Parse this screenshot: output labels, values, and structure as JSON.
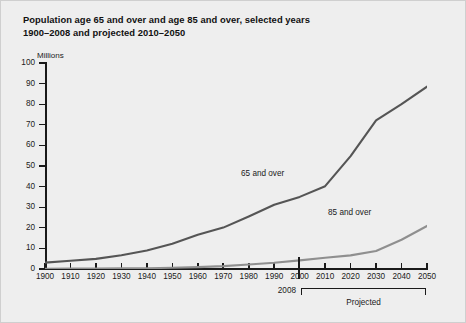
{
  "title": {
    "line1": "Population age 65 and over and age 85 and over, selected years",
    "line2": "1900–2008 and projected 2010–2050"
  },
  "axis_title": "Millions",
  "annotations": {
    "divider_year": "2008",
    "projected": "Projected"
  },
  "colors": {
    "background": "#eeeeee",
    "axis": "#1a1a1a",
    "series_65": "#555555",
    "series_85": "#8f8f8f",
    "border": "#cfcfcf"
  },
  "chart_data": {
    "type": "line",
    "title": "Population age 65 and over and age 85 and over, selected years 1900–2008 and projected 2010–2050",
    "xlabel": "",
    "ylabel": "Millions",
    "xlim": [
      1900,
      2050
    ],
    "ylim": [
      0,
      100
    ],
    "yticks": [
      0,
      10,
      20,
      30,
      40,
      50,
      60,
      70,
      80,
      90,
      100
    ],
    "xticks": [
      1900,
      1910,
      1920,
      1930,
      1940,
      1950,
      1960,
      1970,
      1980,
      1990,
      2000,
      2010,
      2020,
      2030,
      2040,
      2050
    ],
    "grid": false,
    "legend": "inline-labels",
    "projection_start": 2010,
    "x": [
      1900,
      1910,
      1920,
      1930,
      1940,
      1950,
      1960,
      1970,
      1980,
      1990,
      2000,
      2010,
      2020,
      2030,
      2040,
      2050
    ],
    "series": [
      {
        "name": "65 and over",
        "color": "#555555",
        "values": [
          3.1,
          4.0,
          4.9,
          6.7,
          9.0,
          12.3,
          16.6,
          20.1,
          25.5,
          31.2,
          35.0,
          40.2,
          54.8,
          72.1,
          80.0,
          88.5
        ]
      },
      {
        "name": "85 and over",
        "color": "#8f8f8f",
        "values": [
          0.1,
          0.2,
          0.2,
          0.3,
          0.4,
          0.6,
          0.9,
          1.4,
          2.2,
          3.0,
          4.2,
          5.5,
          6.6,
          8.7,
          14.2,
          20.9
        ]
      }
    ]
  }
}
